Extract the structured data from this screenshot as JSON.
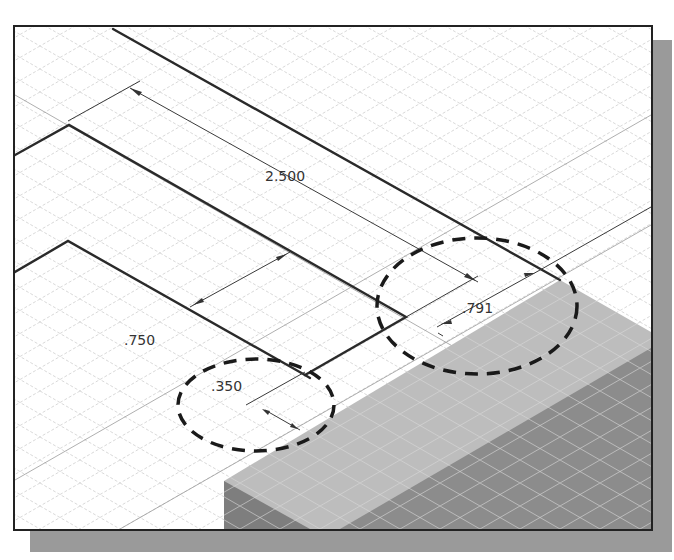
{
  "figure": {
    "type": "isometric-cad-sketch",
    "dimensions": [
      {
        "id": "overall-length",
        "label": "2.500",
        "x": 265,
        "y": 181
      },
      {
        "id": "profile-width",
        "label": ".750",
        "x": 124,
        "y": 345
      },
      {
        "id": "offset-small",
        "label": ".350",
        "x": 211,
        "y": 391
      },
      {
        "id": "offset-right",
        "label": ".791",
        "x": 462,
        "y": 313
      }
    ],
    "callouts": [
      {
        "id": "callout-350",
        "shape": "dashed-ellipse",
        "cx": 256,
        "cy": 405,
        "rx": 78,
        "ry": 46
      },
      {
        "id": "callout-791",
        "shape": "dashed-ellipse",
        "cx": 477,
        "cy": 306,
        "rx": 100,
        "ry": 68
      }
    ],
    "colors": {
      "frame_border": "#222222",
      "shadow": "#9a9a9a",
      "grid_line": "#c8c8c8",
      "sketch_line": "#2a2a2a",
      "solid_top": "#bdbdbd",
      "solid_side": "#8c8c8c",
      "solid_side_dark": "#7a7a7a",
      "callout": "#1a1a1a"
    }
  }
}
